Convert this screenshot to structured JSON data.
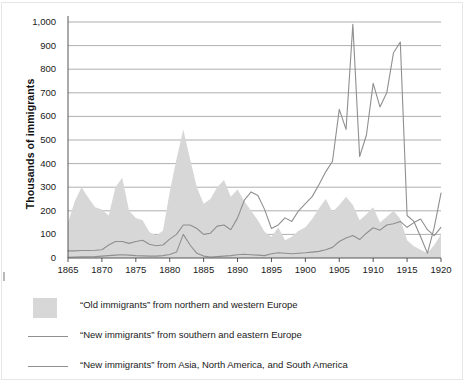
{
  "chart": {
    "y_axis_title": "Thousands of immigrants",
    "y_ticks": [
      "1,000",
      "900",
      "800",
      "700",
      "600",
      "500",
      "400",
      "300",
      "200",
      "100",
      "0"
    ],
    "x_ticks": [
      "1865",
      "1870",
      "1875",
      "1880",
      "1885",
      "1890",
      "1895",
      "1900",
      "1905",
      "1910",
      "1915",
      "1920"
    ]
  },
  "legend": {
    "items": [
      {
        "marker": "area-swatch",
        "label": "“Old immigrants” from northern and western Europe"
      },
      {
        "marker": "line-swatch",
        "label": "“New immigrants” from southern and eastern Europe"
      },
      {
        "marker": "line-swatch",
        "label": "“New immigrants” from Asia, North America, and South America"
      }
    ]
  },
  "colors": {
    "area_fill": "#d7d7d7",
    "line": "#8f8f8f",
    "gridline": "#9a9a9a",
    "axis": "#555555",
    "text": "#1a1a1a"
  },
  "chart_data": {
    "type": "area",
    "title": "",
    "xlabel": "",
    "ylabel": "Thousands of immigrants",
    "xlim": [
      1865,
      1920
    ],
    "ylim": [
      0,
      1000
    ],
    "grid": true,
    "legend_position": "below",
    "x": [
      1865,
      1866,
      1867,
      1868,
      1869,
      1870,
      1871,
      1872,
      1873,
      1874,
      1875,
      1876,
      1877,
      1878,
      1879,
      1880,
      1881,
      1882,
      1883,
      1884,
      1885,
      1886,
      1887,
      1888,
      1889,
      1890,
      1891,
      1892,
      1893,
      1894,
      1895,
      1896,
      1897,
      1898,
      1899,
      1900,
      1901,
      1902,
      1903,
      1904,
      1905,
      1906,
      1907,
      1908,
      1909,
      1910,
      1911,
      1912,
      1913,
      1914,
      1915,
      1916,
      1917,
      1918,
      1919,
      1920
    ],
    "series": [
      {
        "name": "“Old immigrants” from northern and western Europe",
        "type": "area",
        "values": [
          150,
          240,
          300,
          255,
          215,
          205,
          180,
          300,
          340,
          200,
          170,
          160,
          110,
          95,
          115,
          280,
          420,
          545,
          420,
          300,
          230,
          250,
          300,
          330,
          260,
          290,
          240,
          200,
          160,
          110,
          90,
          130,
          75,
          90,
          115,
          130,
          165,
          210,
          250,
          195,
          225,
          260,
          225,
          160,
          185,
          215,
          150,
          175,
          200,
          165,
          75,
          50,
          35,
          20,
          55,
          100
        ]
      },
      {
        "name": "“New immigrants” from southern and eastern Europe",
        "type": "line",
        "values": [
          30,
          30,
          32,
          32,
          33,
          35,
          55,
          70,
          70,
          62,
          70,
          75,
          58,
          52,
          55,
          80,
          100,
          140,
          140,
          125,
          100,
          105,
          135,
          140,
          120,
          170,
          245,
          280,
          265,
          205,
          125,
          140,
          170,
          155,
          200,
          230,
          260,
          310,
          365,
          410,
          630,
          545,
          990,
          430,
          520,
          740,
          640,
          700,
          870,
          915,
          180,
          155,
          90,
          20,
          130,
          275
        ]
      },
      {
        "name": "“New immigrants” from Asia, North America, and South America",
        "type": "line",
        "values": [
          3,
          4,
          5,
          5,
          6,
          8,
          10,
          12,
          14,
          12,
          10,
          9,
          8,
          8,
          10,
          15,
          25,
          100,
          55,
          20,
          8,
          4,
          6,
          8,
          10,
          14,
          16,
          14,
          12,
          10,
          18,
          22,
          20,
          18,
          20,
          22,
          25,
          28,
          35,
          45,
          70,
          85,
          95,
          78,
          105,
          128,
          118,
          140,
          145,
          155,
          130,
          150,
          165,
          120,
          95,
          130
        ]
      }
    ]
  }
}
